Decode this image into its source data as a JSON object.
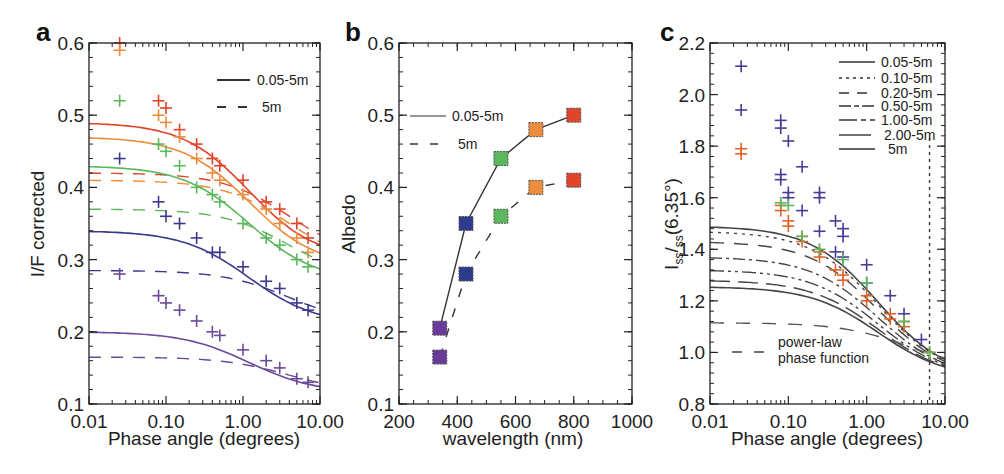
{
  "figure": {
    "panels": [
      {
        "id": "a",
        "label": "a",
        "xlabel": "Phase angle (degrees)",
        "ylabel": "I/F corrected",
        "xticks": [
          "0.01",
          "0.10",
          "1.00",
          "10.00"
        ],
        "yticks": [
          "0.1",
          "0.2",
          "0.3",
          "0.4",
          "0.5",
          "0.6"
        ],
        "legend": [
          {
            "style": "solid",
            "label": "0.05-5m"
          },
          {
            "style": "dashed",
            "label": "5m"
          }
        ]
      },
      {
        "id": "b",
        "label": "b",
        "xlabel": "wavelength (nm)",
        "ylabel": "Albedo",
        "xticks": [
          "200",
          "400",
          "600",
          "800",
          "1000"
        ],
        "yticks": [
          "0.1",
          "0.2",
          "0.3",
          "0.4",
          "0.5",
          "0.6"
        ],
        "legend": [
          {
            "style": "solid",
            "label": "0.05-5m"
          },
          {
            "style": "dashed",
            "label": "5m"
          }
        ]
      },
      {
        "id": "c",
        "label": "c",
        "xlabel": "Phase angle (degrees)",
        "ylabel_main": "I",
        "ylabel_sub1": "ss",
        "ylabel_mid": "/",
        "ylabel_sub2": "ss",
        "ylabel_tail": "(6.35°)",
        "xticks": [
          "0.01",
          "0.10",
          "1.00",
          "10.00"
        ],
        "yticks": [
          "0.8",
          "1.0",
          "1.2",
          "1.4",
          "1.6",
          "1.8",
          "2.0",
          "2.2"
        ],
        "legend": [
          {
            "style": "solid",
            "label": "0.05-5m"
          },
          {
            "style": "dotted",
            "label": "0.10-5m"
          },
          {
            "style": "longdash",
            "label": "0.20-5m"
          },
          {
            "style": "dashdot",
            "label": "0.50-5m"
          },
          {
            "style": "dashdotdot",
            "label": "1.00-5m"
          },
          {
            "style": "longlongdash",
            "label": "2.00-5m"
          },
          {
            "style": "solid",
            "label": "5m"
          }
        ],
        "annotation_line1": "power-law",
        "annotation_line2": "phase function"
      }
    ]
  },
  "colors": {
    "red": "#e0442a",
    "orange": "#ec8c3c",
    "green": "#5cb85c",
    "blue": "#3a3a8c",
    "purple": "#6a4a9a",
    "black": "#333333"
  },
  "chart_data": [
    {
      "type": "scatter",
      "title": "a",
      "xlabel": "Phase angle (degrees)",
      "ylabel": "I/F corrected",
      "xscale": "log",
      "xlim": [
        0.01,
        10
      ],
      "ylim": [
        0.1,
        0.6
      ],
      "legend": [
        "0.05-5m (solid fit)",
        "5m (dashed fit)"
      ],
      "series": [
        {
          "name": "red (~800nm)",
          "color": "#e0442a",
          "points": [
            [
              0.025,
              0.6
            ],
            [
              0.08,
              0.52
            ],
            [
              0.1,
              0.51
            ],
            [
              0.15,
              0.48
            ],
            [
              0.25,
              0.46
            ],
            [
              0.4,
              0.44
            ],
            [
              0.5,
              0.43
            ],
            [
              1.0,
              0.41
            ],
            [
              2.0,
              0.38
            ],
            [
              3.0,
              0.37
            ],
            [
              5.0,
              0.35
            ],
            [
              7.0,
              0.33
            ]
          ],
          "fit_solid_start": 0.49,
          "fit_dashed_start": 0.42
        },
        {
          "name": "orange (~670nm)",
          "color": "#ec8c3c",
          "points": [
            [
              0.025,
              0.59
            ],
            [
              0.08,
              0.5
            ],
            [
              0.1,
              0.49
            ],
            [
              0.15,
              0.47
            ],
            [
              0.25,
              0.44
            ],
            [
              0.4,
              0.42
            ],
            [
              0.5,
              0.41
            ],
            [
              1.0,
              0.39
            ],
            [
              2.0,
              0.37
            ],
            [
              3.0,
              0.35
            ],
            [
              5.0,
              0.33
            ],
            [
              7.0,
              0.31
            ]
          ],
          "fit_solid_start": 0.47,
          "fit_dashed_start": 0.41
        },
        {
          "name": "green (~550nm)",
          "color": "#5cb85c",
          "points": [
            [
              0.025,
              0.52
            ],
            [
              0.08,
              0.46
            ],
            [
              0.1,
              0.45
            ],
            [
              0.15,
              0.43
            ],
            [
              0.25,
              0.4
            ],
            [
              0.4,
              0.39
            ],
            [
              0.5,
              0.38
            ],
            [
              1.0,
              0.35
            ],
            [
              2.0,
              0.33
            ],
            [
              3.0,
              0.32
            ],
            [
              5.0,
              0.3
            ],
            [
              7.0,
              0.29
            ]
          ],
          "fit_solid_start": 0.43,
          "fit_dashed_start": 0.37
        },
        {
          "name": "blue (~430nm)",
          "color": "#3a3a8c",
          "points": [
            [
              0.025,
              0.44
            ],
            [
              0.08,
              0.38
            ],
            [
              0.1,
              0.36
            ],
            [
              0.15,
              0.35
            ],
            [
              0.25,
              0.33
            ],
            [
              0.4,
              0.31
            ],
            [
              0.5,
              0.31
            ],
            [
              1.0,
              0.29
            ],
            [
              2.0,
              0.27
            ],
            [
              3.0,
              0.26
            ],
            [
              5.0,
              0.24
            ],
            [
              7.0,
              0.23
            ]
          ],
          "fit_solid_start": 0.34,
          "fit_dashed_start": 0.285
        },
        {
          "name": "purple (~340nm)",
          "color": "#6a4a9a",
          "points": [
            [
              0.025,
              0.28
            ],
            [
              0.08,
              0.25
            ],
            [
              0.1,
              0.24
            ],
            [
              0.15,
              0.23
            ],
            [
              0.25,
              0.215
            ],
            [
              0.4,
              0.2
            ],
            [
              0.5,
              0.195
            ],
            [
              1.0,
              0.175
            ],
            [
              2.0,
              0.16
            ],
            [
              3.0,
              0.15
            ],
            [
              5.0,
              0.135
            ],
            [
              7.0,
              0.13
            ]
          ],
          "fit_solid_start": 0.2,
          "fit_dashed_start": 0.165
        }
      ]
    },
    {
      "type": "line",
      "title": "b",
      "xlabel": "wavelength (nm)",
      "ylabel": "Albedo",
      "xlim": [
        200,
        1000
      ],
      "ylim": [
        0.1,
        0.6
      ],
      "x": [
        340,
        430,
        550,
        670,
        800
      ],
      "series": [
        {
          "name": "0.05-5m",
          "style": "solid",
          "values": [
            0.205,
            0.35,
            0.44,
            0.48,
            0.5
          ]
        },
        {
          "name": "5m",
          "style": "dashed",
          "values": [
            0.165,
            0.28,
            0.36,
            0.4,
            0.41
          ]
        }
      ],
      "marker_colors": [
        "#6a3a9a",
        "#2e3a8c",
        "#5cb85c",
        "#ec8c3c",
        "#e0442a"
      ]
    },
    {
      "type": "scatter",
      "title": "c",
      "xlabel": "Phase angle (degrees)",
      "ylabel": "Iss/Iss(6.35°)",
      "xscale": "log",
      "xlim": [
        0.01,
        10
      ],
      "ylim": [
        0.8,
        2.2
      ],
      "vline": 6.35,
      "legend": [
        "0.05-5m",
        "0.10-5m",
        "0.20-5m",
        "0.50-5m",
        "1.00-5m",
        "2.00-5m",
        "5m",
        "power-law phase function"
      ],
      "fit_starts": {
        "0.05-5m": 1.49,
        "0.10-5m": 1.47,
        "0.20-5m": 1.43,
        "0.50-5m": 1.37,
        "1.00-5m": 1.32,
        "2.00-5m": 1.28,
        "5m": 1.255,
        "power-law": 1.115
      },
      "series": [
        {
          "name": "blue/purple points",
          "color": "#4a3a9a",
          "points": [
            [
              0.025,
              2.11
            ],
            [
              0.025,
              1.94
            ],
            [
              0.08,
              1.9
            ],
            [
              0.08,
              1.87
            ],
            [
              0.1,
              1.82
            ],
            [
              0.08,
              1.69
            ],
            [
              0.08,
              1.67
            ],
            [
              0.1,
              1.62
            ],
            [
              0.1,
              1.6
            ],
            [
              0.15,
              1.72
            ],
            [
              0.15,
              1.55
            ],
            [
              0.25,
              1.62
            ],
            [
              0.25,
              1.6
            ],
            [
              0.25,
              1.47
            ],
            [
              0.4,
              1.51
            ],
            [
              0.5,
              1.48
            ],
            [
              0.5,
              1.45
            ],
            [
              0.4,
              1.39
            ],
            [
              0.5,
              1.37
            ],
            [
              1.0,
              1.34
            ],
            [
              1.0,
              1.27
            ],
            [
              2.0,
              1.22
            ],
            [
              3.0,
              1.15
            ],
            [
              5.0,
              1.05
            ]
          ]
        },
        {
          "name": "orange/red points",
          "color": "#e0642a",
          "points": [
            [
              0.025,
              1.79
            ],
            [
              0.025,
              1.77
            ],
            [
              0.08,
              1.57
            ],
            [
              0.08,
              1.55
            ],
            [
              0.1,
              1.51
            ],
            [
              0.1,
              1.49
            ],
            [
              0.15,
              1.45
            ],
            [
              0.15,
              1.43
            ],
            [
              0.25,
              1.39
            ],
            [
              0.25,
              1.37
            ],
            [
              0.4,
              1.32
            ],
            [
              0.5,
              1.3
            ],
            [
              0.5,
              1.28
            ],
            [
              1.0,
              1.22
            ],
            [
              1.0,
              1.2
            ],
            [
              2.0,
              1.15
            ],
            [
              2.0,
              1.13
            ],
            [
              3.0,
              1.12
            ],
            [
              3.0,
              1.1
            ],
            [
              6.35,
              1.0
            ]
          ]
        },
        {
          "name": "green points",
          "color": "#5cb85c",
          "points": [
            [
              0.08,
              1.58
            ],
            [
              0.1,
              1.57
            ],
            [
              0.15,
              1.45
            ],
            [
              0.25,
              1.4
            ],
            [
              0.5,
              1.36
            ],
            [
              1.0,
              1.27
            ],
            [
              3.0,
              1.12
            ],
            [
              6.35,
              1.0
            ]
          ]
        }
      ]
    }
  ]
}
